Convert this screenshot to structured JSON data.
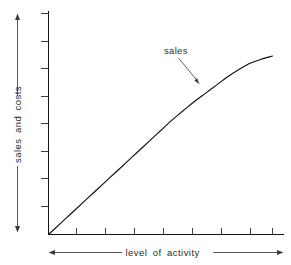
{
  "figure": {
    "background_color": "#ffffff",
    "line_color": "#101010",
    "label_color": "#2b2b2b",
    "width": 291,
    "height": 265
  },
  "labels": {
    "y_axis": "sales and costs",
    "x_axis": "level  of  activity",
    "series_callout": "sales"
  },
  "chart_data": {
    "type": "line",
    "title": "",
    "xlabel": "level of activity",
    "ylabel": "sales and costs",
    "xlim": [
      0,
      100
    ],
    "ylim": [
      0,
      100
    ],
    "grid": false,
    "legend": "none",
    "axis_tick_labels": {
      "x": [],
      "y": []
    },
    "x_tick_count": 8,
    "y_tick_count": 8,
    "annotations": [
      {
        "text": "sales",
        "points_to_series": "sales",
        "arrow": true,
        "x": 55,
        "y": 82
      }
    ],
    "series": [
      {
        "name": "sales",
        "style": "solid",
        "color": "#101010",
        "description": "Revenue curve rising linearly from the origin then flattening at higher activity levels (diminishing marginal sales).",
        "x": [
          0,
          5,
          10,
          15,
          20,
          25,
          30,
          35,
          40,
          45,
          50,
          55,
          60,
          65,
          70,
          75,
          80,
          85,
          90,
          95,
          100
        ],
        "y": [
          0,
          5,
          10,
          15,
          20,
          25,
          30,
          35,
          40,
          45,
          50,
          55,
          59.5,
          64,
          68,
          72,
          76,
          79.5,
          82.5,
          84.5,
          86
        ]
      }
    ]
  }
}
